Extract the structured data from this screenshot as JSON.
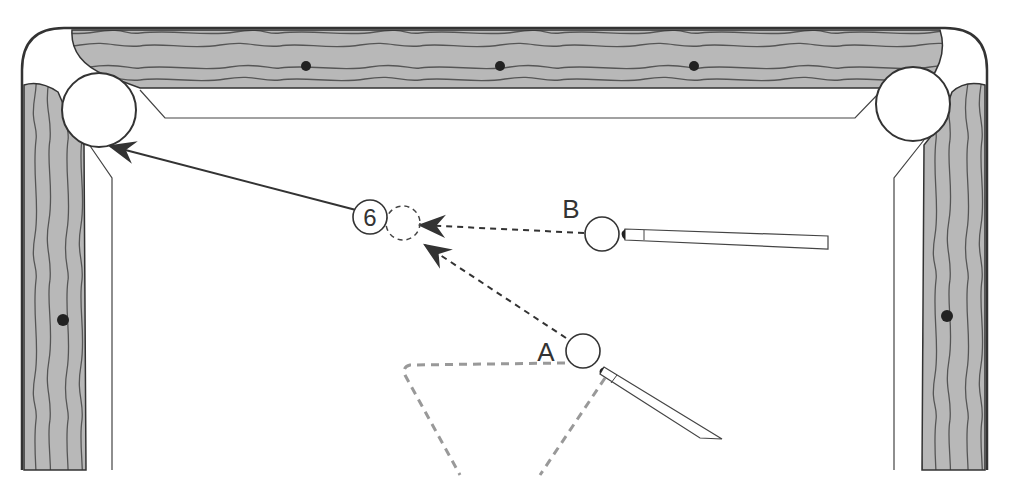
{
  "diagram": {
    "colors": {
      "rail_wood": "#b8b8b8",
      "grain": "#555555",
      "outline": "#333333",
      "felt": "#ffffff",
      "guide_dash": "#999999"
    },
    "object_ball": {
      "label": "6"
    },
    "cue_balls": [
      {
        "id": "A",
        "label": "A"
      },
      {
        "id": "B",
        "label": "B"
      }
    ],
    "paths": [
      {
        "from": "B",
        "to": "ghost-ball",
        "style": "dashed-arrow"
      },
      {
        "from": "A",
        "to": "ghost-ball",
        "style": "dashed-arrow"
      },
      {
        "from": "6",
        "to": "top-left-pocket",
        "style": "solid-arrow"
      }
    ],
    "pockets": [
      "top-left-pocket",
      "top-right-pocket"
    ],
    "diamonds": {
      "top_rail": 3,
      "left_rail": 1,
      "right_rail": 1
    }
  }
}
